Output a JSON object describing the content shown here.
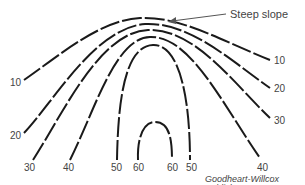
{
  "diagram": {
    "type": "contour-map",
    "callout": {
      "text": "Steep slope"
    },
    "credit": "Goodheart-Willcox Publisher",
    "contours": [
      {
        "value": "10",
        "left_label": "10",
        "right_label": "10"
      },
      {
        "value": "20",
        "left_label": "20",
        "right_label": "20"
      },
      {
        "value": "30",
        "left_label": "30",
        "right_label": "30"
      },
      {
        "value": "40",
        "left_label": "40",
        "right_label": "40"
      },
      {
        "value": "50",
        "left_label": "50",
        "right_label": "50"
      },
      {
        "value": "60",
        "left_label": "60",
        "right_label": "60"
      }
    ],
    "colors": {
      "line": "#1a1a1a",
      "text": "#444444",
      "background": "#ffffff"
    }
  }
}
